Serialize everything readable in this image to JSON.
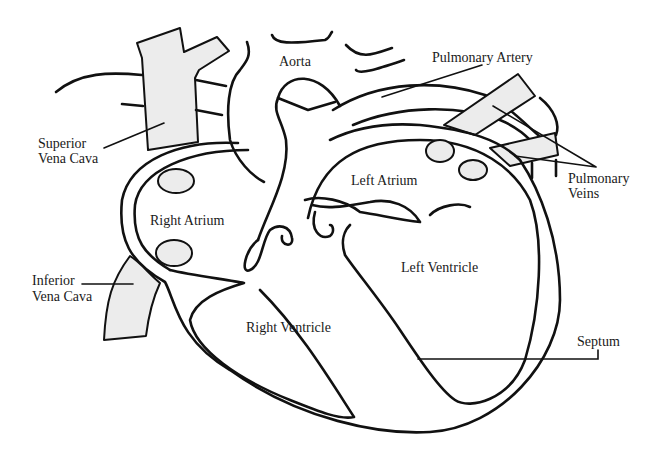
{
  "diagram": {
    "fill_color": "#ececec",
    "stroke_color": "#111111",
    "labels": {
      "aorta": "Aorta",
      "pulmonary_artery": "Pulmonary Artery",
      "superior_vena_cava_1": "Superior",
      "superior_vena_cava_2": "Vena Cava",
      "pulmonary_veins_1": "Pulmonary",
      "pulmonary_veins_2": "Veins",
      "left_atrium": "Left Atrium",
      "right_atrium": "Right Atrium",
      "left_ventricle": "Left Ventricle",
      "inferior_vena_cava_1": "Inferior",
      "inferior_vena_cava_2": "Vena Cava",
      "right_ventricle": "Right Ventricle",
      "septum": "Septum"
    }
  }
}
